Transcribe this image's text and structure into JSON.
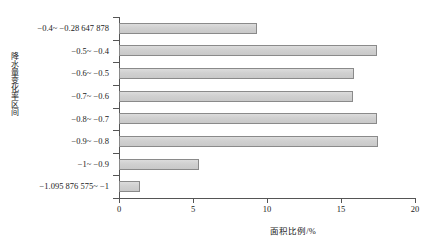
{
  "chart_data": {
    "type": "bar",
    "orientation": "horizontal",
    "title": "",
    "xlabel": "面积比例/%",
    "ylabel": "降水量变化率区间",
    "xlim": [
      0,
      20
    ],
    "ylim": null,
    "grid": false,
    "legend": null,
    "xticks": [
      "0",
      "5",
      "10",
      "15",
      "20"
    ],
    "xtick_values": [
      0,
      5,
      10,
      15,
      20
    ],
    "categories": [
      "−0.4~ −0.28 647 878",
      "−0.5~ −0.4",
      "−0.6~ −0.5",
      "−0.7~ −0.6",
      "−0.8~ −0.7",
      "−0.9~ −0.8",
      "−1~ −0.9",
      "−1.095 876 575~ −1"
    ],
    "values": [
      9.3,
      17.4,
      15.9,
      15.8,
      17.4,
      17.5,
      5.4,
      1.4
    ],
    "series": [
      {
        "name": "面积比例",
        "values": [
          9.3,
          17.4,
          15.9,
          15.8,
          17.4,
          17.5,
          5.4,
          1.4
        ]
      }
    ],
    "bar_fill_color": "#d2d2d2",
    "bar_border_color": "#8a8a8a",
    "axis_color": "#555555"
  }
}
